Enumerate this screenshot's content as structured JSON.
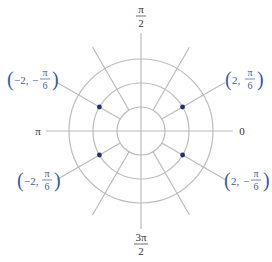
{
  "diagram": {
    "type": "polar-grid",
    "center": [
      141,
      131
    ],
    "unit_radius_px": 24,
    "circle_radii": [
      1,
      2,
      3
    ],
    "radial_line_length_px": 97,
    "axis_extent": {
      "left": 46,
      "right": 233,
      "top": 33,
      "bottom": 229
    },
    "radial_angles_deg": [
      30,
      60,
      120,
      150,
      210,
      240,
      300,
      330
    ],
    "colors": {
      "grid": "#bcbcbc",
      "point": "#1c2f82",
      "label": "#3b5aa6",
      "axis_label": "#333333"
    },
    "axis_labels": {
      "right": {
        "text": "0"
      },
      "left": {
        "text": "π"
      },
      "top": {
        "numerator": "π",
        "denominator": "2"
      },
      "bottom": {
        "numerator": "3π",
        "denominator": "2"
      }
    },
    "points": [
      {
        "name": "point-2-pi6",
        "r": 2,
        "theta_deg": 30,
        "label_prefix": "2, ",
        "label_sign": "",
        "numerator": "π",
        "denominator": "6"
      },
      {
        "name": "point-neg2-negpi6",
        "r": 2,
        "theta_deg": 150,
        "label_prefix": "−2, ",
        "label_sign": "−",
        "numerator": "π",
        "denominator": "6"
      },
      {
        "name": "point-neg2-pi6",
        "r": 2,
        "theta_deg": 210,
        "label_prefix": "−2, ",
        "label_sign": "",
        "numerator": "π",
        "denominator": "6"
      },
      {
        "name": "point-2-negpi6",
        "r": 2,
        "theta_deg": 330,
        "label_prefix": "2, ",
        "label_sign": "−",
        "numerator": "π",
        "denominator": "6"
      }
    ]
  }
}
